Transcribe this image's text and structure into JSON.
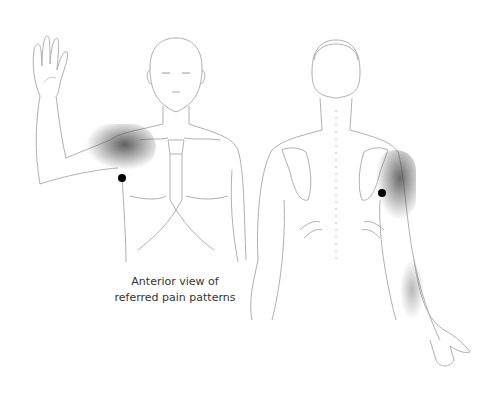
{
  "caption": {
    "line1": "Anterior view of",
    "line2": "referred pain patterns"
  },
  "figures": [
    {
      "view": "anterior",
      "arm_raised": "right-of-figure",
      "pain_area": "front shoulder / deltoid",
      "trigger_point": "axilla"
    },
    {
      "view": "posterior",
      "pain_area": "posterior shoulder and lateral arm to forearm",
      "trigger_point": "posterior axilla"
    }
  ],
  "colors": {
    "line": "#b0b0b0",
    "pain_shade": "#555555",
    "trigger_point": "#000000",
    "caption_text": "#333333",
    "background": "#ffffff"
  }
}
